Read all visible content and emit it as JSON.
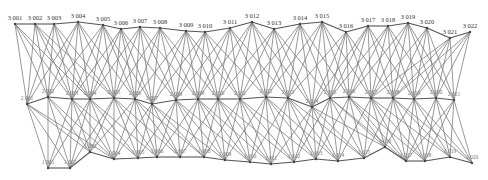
{
  "diagram": {
    "title": "",
    "rows": [
      {
        "name": "top",
        "labels": [
          "3 001",
          "3 002",
          "3 003",
          "3 004",
          "3 005",
          "3 006",
          "3 007",
          "3 008",
          "3 009",
          "3 010",
          "3 011",
          "3 012",
          "3 013",
          "3 014",
          "3 015",
          "3 016",
          "3 017",
          "3 018",
          "3 019",
          "3 020",
          "3 021",
          "3 022"
        ]
      },
      {
        "name": "middle",
        "labels": [
          "2 001",
          "2 002",
          "2 003",
          "2 004",
          "2 005",
          "2 006",
          "2 007",
          "2 008",
          "2 009",
          "2 010",
          "2 011",
          "2 012",
          "2 013",
          "2 014",
          "2 015",
          "2 016",
          "2 017",
          "2 018",
          "2 019",
          "2 020",
          "2 021"
        ]
      },
      {
        "name": "bottom",
        "labels": [
          "1 001",
          "1 002",
          "1 003",
          "1 004",
          "1 005",
          "1 006",
          "1 007",
          "1 008",
          "1 009",
          "1 010",
          "1 011",
          "1 012",
          "1 013",
          "1 014",
          "1 015",
          "1 016",
          "1 017",
          "1 018",
          "1 019",
          "1 020"
        ]
      }
    ],
    "connectivity": "each node links to nodes within 3 positions in the adjacent layer; neighbouring nodes in a layer are chained"
  }
}
